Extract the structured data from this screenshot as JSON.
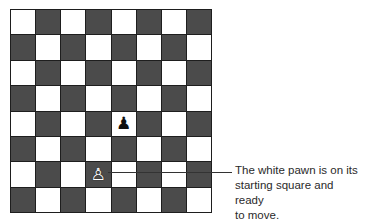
{
  "board": {
    "size": 8,
    "colors": {
      "light": "#ffffff",
      "dark": "#4b4b4b",
      "border": "#1e1e1e"
    },
    "top_left_square": "light",
    "pieces": [
      {
        "name": "black-pawn",
        "glyph": "♟",
        "color": "black",
        "row": 4,
        "col": 4
      },
      {
        "name": "white-pawn",
        "glyph": "♙",
        "color": "white",
        "row": 6,
        "col": 3
      }
    ]
  },
  "callout": {
    "target": "white-pawn",
    "lines": [
      "The white pawn is on its",
      "starting square and ready",
      "to move."
    ],
    "text": "The white pawn is on its starting square and ready to move."
  }
}
